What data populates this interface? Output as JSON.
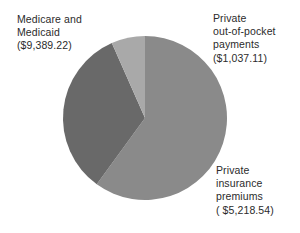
{
  "chart_data": {
    "type": "pie",
    "title": "",
    "subtitle": "",
    "xlabel": "",
    "ylabel": "",
    "legend_position": "none",
    "grid": false,
    "labels_as_callouts": true,
    "total": 15644.87,
    "currency_symbol": "$",
    "categories": [
      "Medicare and Medicaid",
      "Private insurance premiums",
      "Private out-of-pocket payments"
    ],
    "values": [
      9389.22,
      5218.54,
      1037.11
    ],
    "percentages": [
      60.0,
      33.4,
      6.6
    ],
    "colors": [
      "#8a8a8a",
      "#696969",
      "#a9a9a9"
    ],
    "slices": [
      {
        "name": "Medicare and Medicaid",
        "value": 9389.22,
        "value_text": "($9,389.22)",
        "percent": 60.0,
        "color": "#8a8a8a",
        "start_angle": 0,
        "end_angle": 216.1
      },
      {
        "name": "Private insurance premiums",
        "value": 5218.54,
        "value_text": "( $5,218.54)",
        "percent": 33.4,
        "color": "#696969",
        "start_angle": 216.1,
        "end_angle": 336.2
      },
      {
        "name": "Private out-of-pocket payments",
        "value": 1037.11,
        "value_text": "($1,037.11)",
        "percent": 6.6,
        "color": "#a9a9a9",
        "start_angle": 336.2,
        "end_angle": 360
      }
    ]
  },
  "labels": {
    "medicaid": {
      "line1": "Medicare and",
      "line2": "Medicaid",
      "line3": "($9,389.22)"
    },
    "out_of_pocket": {
      "line1": "Private",
      "line2": "out-of-pocket",
      "line3": "payments",
      "line4": "($1,037.11)"
    },
    "premiums": {
      "line1": "Private",
      "line2": "insurance",
      "line3": "premiums",
      "line4": "( $5,218.54)"
    }
  },
  "colors": {
    "background": "#ffffff",
    "text": "#2b2b2b",
    "slice_medicaid": "#8a8a8a",
    "slice_premiums": "#696969",
    "slice_out_of_pocket": "#a9a9a9"
  }
}
